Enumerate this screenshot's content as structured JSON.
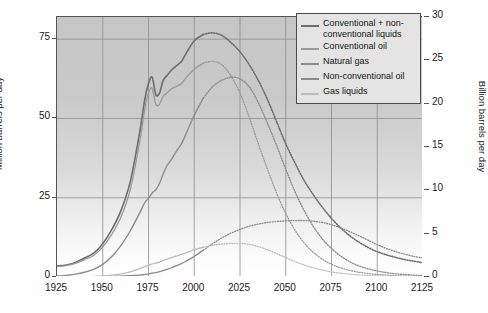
{
  "chart_data": {
    "type": "line",
    "title": "",
    "xlabel": "",
    "ylabel": "Million barrels per day",
    "ylabel_right": "Billion barrels per day",
    "xlim": [
      1925,
      2125
    ],
    "ylim": [
      0,
      82
    ],
    "ylim_right": [
      0,
      30
    ],
    "xticks": [
      1925,
      1950,
      1975,
      2000,
      2025,
      2050,
      2075,
      2100,
      2125
    ],
    "yticks_left": [
      0,
      25,
      50,
      75
    ],
    "yticks_right": [
      0,
      5,
      10,
      15,
      20,
      25,
      30
    ],
    "grid": true,
    "legend_position": "top-right",
    "history_projection_split_year": 2005,
    "x": [
      1925,
      1930,
      1935,
      1940,
      1945,
      1950,
      1955,
      1960,
      1965,
      1970,
      1973,
      1975,
      1977,
      1979,
      1981,
      1983,
      1985,
      1988,
      1990,
      1993,
      1995,
      2000,
      2005,
      2010,
      2015,
      2020,
      2025,
      2030,
      2035,
      2040,
      2045,
      2050,
      2055,
      2060,
      2065,
      2070,
      2075,
      2080,
      2085,
      2090,
      2095,
      2100,
      2105,
      2110,
      2115,
      2120,
      2125
    ],
    "series": [
      {
        "name": "Conventional + non-conventional liquids",
        "color": "#6e6e6e",
        "width": 1.6,
        "values": [
          3.5,
          3.8,
          4.6,
          6.0,
          7.5,
          10.5,
          15.0,
          21.0,
          30.0,
          45.0,
          56.0,
          61.0,
          63.0,
          57.5,
          58.0,
          62.0,
          63.5,
          65.5,
          66.5,
          68.0,
          70.0,
          74.5,
          76.5,
          77.0,
          76.2,
          74.0,
          71.0,
          67.0,
          62.0,
          56.0,
          49.0,
          42.0,
          36.0,
          30.5,
          26.0,
          22.0,
          18.5,
          15.5,
          13.0,
          11.0,
          9.3,
          8.0,
          7.0,
          6.2,
          5.5,
          5.0,
          4.5
        ]
      },
      {
        "name": "Conventional oil",
        "color": "#9a9a9a",
        "width": 1.3,
        "values": [
          3.3,
          3.6,
          4.3,
          5.5,
          6.8,
          9.5,
          13.5,
          19.0,
          27.5,
          42.0,
          53.0,
          58.0,
          59.5,
          54.5,
          54.5,
          57.0,
          58.0,
          59.5,
          60.0,
          61.0,
          62.5,
          65.5,
          67.5,
          68.0,
          67.0,
          63.5,
          58.0,
          50.5,
          42.0,
          34.0,
          26.5,
          20.0,
          14.8,
          10.8,
          7.8,
          5.6,
          4.0,
          2.9,
          2.1,
          1.5,
          1.1,
          0.8,
          0.6,
          0.4,
          0.3,
          0.2,
          0.15
        ]
      },
      {
        "name": "Natural gas",
        "color": "#8d8d8d",
        "width": 1.4,
        "values": [
          0.3,
          0.5,
          0.9,
          1.5,
          2.4,
          4.0,
          6.5,
          10.0,
          14.5,
          20.0,
          23.5,
          24.8,
          26.5,
          27.5,
          29.5,
          32.5,
          35.0,
          37.5,
          39.5,
          42.0,
          44.5,
          51.0,
          56.5,
          60.0,
          62.0,
          63.0,
          62.5,
          60.0,
          55.0,
          48.5,
          41.5,
          34.0,
          27.0,
          21.0,
          16.0,
          12.0,
          9.0,
          6.6,
          4.8,
          3.5,
          2.6,
          1.9,
          1.4,
          1.0,
          0.8,
          0.6,
          0.45
        ]
      },
      {
        "name": "Non-conventional oil",
        "color": "#8a8a8a",
        "width": 1.3,
        "values": [
          0.05,
          0.05,
          0.06,
          0.08,
          0.1,
          0.15,
          0.2,
          0.3,
          0.4,
          0.6,
          0.8,
          1.0,
          1.2,
          1.4,
          1.7,
          2.0,
          2.4,
          3.0,
          3.5,
          4.2,
          4.8,
          6.5,
          8.5,
          10.5,
          12.3,
          13.8,
          15.0,
          16.0,
          16.7,
          17.2,
          17.5,
          17.7,
          17.8,
          17.8,
          17.6,
          17.2,
          16.5,
          15.5,
          14.3,
          13.0,
          11.6,
          10.2,
          9.0,
          8.0,
          7.2,
          6.5,
          6.0
        ]
      },
      {
        "name": "Gas liquids",
        "color": "#bcbcbc",
        "width": 1.3,
        "values": [
          0.05,
          0.06,
          0.08,
          0.12,
          0.2,
          0.35,
          0.6,
          1.0,
          1.6,
          2.6,
          3.3,
          3.7,
          4.1,
          4.4,
          4.7,
          5.2,
          5.6,
          6.2,
          6.6,
          7.1,
          7.5,
          8.6,
          9.4,
          10.0,
          10.4,
          10.6,
          10.6,
          10.3,
          9.6,
          8.6,
          7.4,
          6.1,
          4.9,
          3.8,
          2.9,
          2.2,
          1.6,
          1.2,
          0.9,
          0.65,
          0.48,
          0.35,
          0.26,
          0.2,
          0.15,
          0.12,
          0.1
        ]
      }
    ]
  },
  "axes": {
    "left_title": "Million barrels per day",
    "right_title": "Billion barrels per day",
    "left_ticks": [
      "75",
      "50",
      "25",
      "0"
    ],
    "right_ticks": [
      "30",
      "25",
      "20",
      "15",
      "10",
      "5",
      "0"
    ],
    "x_ticks": [
      "1925",
      "1950",
      "1975",
      "2000",
      "2025",
      "2050",
      "2075",
      "2100",
      "2125"
    ]
  },
  "legend": {
    "items": [
      {
        "label": "Conventional + non-conventional liquids",
        "color": "#6e6e6e"
      },
      {
        "label": "Conventional oil",
        "color": "#9a9a9a"
      },
      {
        "label": "Natural gas",
        "color": "#8d8d8d"
      },
      {
        "label": "Non-conventional oil",
        "color": "#8a8a8a"
      },
      {
        "label": "Gas liquids",
        "color": "#bcbcbc"
      }
    ]
  }
}
